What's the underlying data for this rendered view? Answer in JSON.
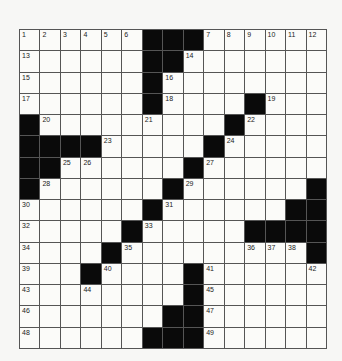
{
  "puzzle": {
    "rows": 15,
    "cols": 15,
    "colors": {
      "background": "#f7f7f5",
      "cell": "#fbfbf9",
      "block": "#0a0a0a",
      "gridline": "#555555",
      "number": "#222222"
    },
    "grid": [
      [
        "1",
        "2",
        "3",
        "4",
        "5",
        "6",
        "#",
        "#",
        "#",
        "7",
        "8",
        "9",
        "10",
        "11",
        "12"
      ],
      [
        "13",
        "",
        "",
        "",
        "",
        "",
        "#",
        "#",
        "14",
        "",
        "",
        "",
        "",
        "",
        ""
      ],
      [
        "15",
        "",
        "",
        "",
        "",
        "",
        "#",
        "16",
        "",
        "",
        "",
        "",
        "",
        "",
        ""
      ],
      [
        "17",
        "",
        "",
        "",
        "",
        "",
        "#",
        "18",
        "",
        "",
        "",
        "#",
        "19",
        "",
        ""
      ],
      [
        "#",
        "20",
        "",
        "",
        "",
        "",
        "21",
        "",
        "",
        "",
        "#",
        "22",
        "",
        "",
        ""
      ],
      [
        "#",
        "#",
        "#",
        "#",
        "23",
        "",
        "",
        "",
        "",
        "#",
        "24",
        "",
        "",
        "",
        ""
      ],
      [
        "#",
        "#",
        "25",
        "26",
        "",
        "",
        "",
        "",
        "#",
        "27",
        "",
        "",
        "",
        "",
        ""
      ],
      [
        "#",
        "28",
        "",
        "",
        "",
        "",
        "",
        "#",
        "29",
        "",
        "",
        "",
        "",
        "",
        "#"
      ],
      [
        "30",
        "",
        "",
        "",
        "",
        "",
        "#",
        "31",
        "",
        "",
        "",
        "",
        "",
        "#",
        "#"
      ],
      [
        "32",
        "",
        "",
        "",
        "",
        "#",
        "33",
        "",
        "",
        "",
        "",
        "#",
        "#",
        "#",
        "#"
      ],
      [
        "34",
        "",
        "",
        "",
        "#",
        "35",
        "",
        "",
        "",
        "",
        "",
        "36",
        "37",
        "38",
        "#"
      ],
      [
        "39",
        "",
        "",
        "#",
        "40",
        "",
        "",
        "",
        "#",
        "41",
        "",
        "",
        "",
        "",
        "42"
      ],
      [
        "43",
        "",
        "",
        "44",
        "",
        "",
        "",
        "",
        "#",
        "45",
        "",
        "",
        "",
        "",
        ""
      ],
      [
        "46",
        "",
        "",
        "",
        "",
        "",
        "",
        "#",
        "#",
        "47",
        "",
        "",
        "",
        "",
        ""
      ],
      [
        "48",
        "",
        "",
        "",
        "",
        "",
        "#",
        "#",
        "#",
        "49",
        "",
        "",
        "",
        "",
        ""
      ]
    ]
  }
}
